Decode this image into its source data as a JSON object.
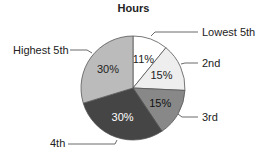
{
  "chart_data": {
    "type": "pie",
    "title": "Hours",
    "start_angle": "top, clockwise",
    "slices": [
      {
        "label": "Lowest 5th",
        "value": 11,
        "display": "11%",
        "color": "#ffffff",
        "text_color": "#222222"
      },
      {
        "label": "2nd",
        "value": 15,
        "display": "15%",
        "color": "#eeeeee",
        "text_color": "#222222"
      },
      {
        "label": "3rd",
        "value": 15,
        "display": "15%",
        "color": "#888888",
        "text_color": "#111111"
      },
      {
        "label": "4th",
        "value": 30,
        "display": "30%",
        "color": "#454545",
        "text_color": "#ffffff"
      },
      {
        "label": "Highest 5th",
        "value": 30,
        "display": "30%",
        "color": "#bbbbbb",
        "text_color": "#222222"
      }
    ]
  }
}
